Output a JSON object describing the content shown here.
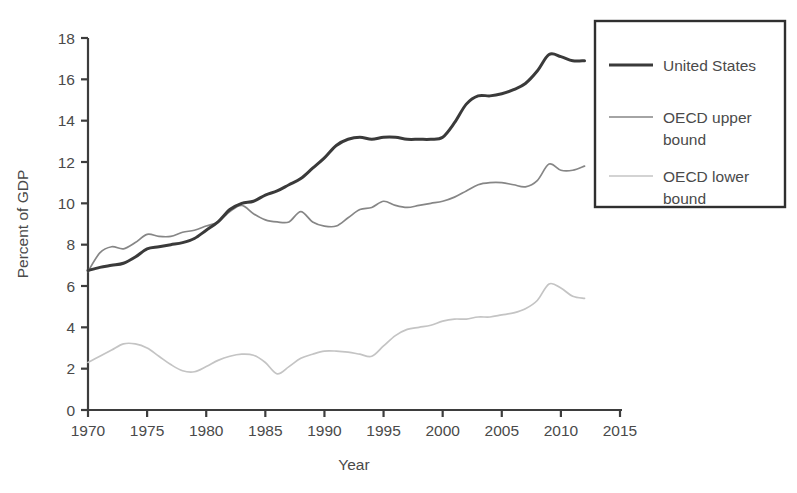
{
  "chart_data": {
    "type": "line",
    "title": "",
    "xlabel": "Year",
    "ylabel": "Percent of GDP",
    "xlim": [
      1970,
      2015
    ],
    "ylim": [
      0,
      18
    ],
    "xticks": [
      1970,
      1975,
      1980,
      1985,
      1990,
      1995,
      2000,
      2005,
      2010,
      2015
    ],
    "yticks": [
      0,
      2,
      4,
      6,
      8,
      10,
      12,
      14,
      16,
      18
    ],
    "grid": false,
    "legend_position": "top-right",
    "x": [
      1970,
      1971,
      1972,
      1973,
      1974,
      1975,
      1976,
      1977,
      1978,
      1979,
      1980,
      1981,
      1982,
      1983,
      1984,
      1985,
      1986,
      1987,
      1988,
      1989,
      1990,
      1991,
      1992,
      1993,
      1994,
      1995,
      1996,
      1997,
      1998,
      1999,
      2000,
      2001,
      2002,
      2003,
      2004,
      2005,
      2006,
      2007,
      2008,
      2009,
      2010,
      2011,
      2012
    ],
    "series": [
      {
        "name": "United States",
        "color": "#3a3a3a",
        "width": 3.0,
        "values": [
          6.75,
          6.9,
          7.0,
          7.1,
          7.4,
          7.8,
          7.9,
          8.0,
          8.1,
          8.3,
          8.7,
          9.1,
          9.7,
          10.0,
          10.1,
          10.4,
          10.6,
          10.9,
          11.2,
          11.7,
          12.2,
          12.8,
          13.1,
          13.2,
          13.1,
          13.2,
          13.2,
          13.1,
          13.1,
          13.1,
          13.2,
          13.9,
          14.8,
          15.2,
          15.2,
          15.3,
          15.5,
          15.8,
          16.4,
          17.2,
          17.1,
          16.9,
          16.9
        ]
      },
      {
        "name": "OECD upper bound",
        "color": "#868686",
        "width": 1.7,
        "values": [
          6.7,
          7.6,
          7.9,
          7.8,
          8.1,
          8.5,
          8.4,
          8.4,
          8.6,
          8.7,
          8.9,
          9.1,
          9.6,
          9.9,
          9.5,
          9.2,
          9.1,
          9.1,
          9.6,
          9.1,
          8.9,
          8.9,
          9.3,
          9.7,
          9.8,
          10.1,
          9.9,
          9.8,
          9.9,
          10.0,
          10.1,
          10.3,
          10.6,
          10.9,
          11.0,
          11.0,
          10.9,
          10.8,
          11.1,
          11.9,
          11.6,
          11.6,
          11.8
        ]
      },
      {
        "name": "OECD lower bound",
        "color": "#c4c4c4",
        "width": 1.7,
        "values": [
          2.3,
          2.6,
          2.9,
          3.2,
          3.2,
          3.0,
          2.6,
          2.2,
          1.9,
          1.85,
          2.1,
          2.4,
          2.6,
          2.7,
          2.65,
          2.3,
          1.75,
          2.1,
          2.5,
          2.7,
          2.85,
          2.85,
          2.8,
          2.7,
          2.6,
          3.1,
          3.6,
          3.9,
          4.0,
          4.1,
          4.3,
          4.4,
          4.4,
          4.5,
          4.5,
          4.6,
          4.7,
          4.9,
          5.3,
          6.1,
          5.9,
          5.5,
          5.4
        ]
      }
    ]
  },
  "legend": {
    "items": [
      {
        "label": "United States"
      },
      {
        "label": "OECD upper bound"
      },
      {
        "label": "OECD lower bound"
      }
    ]
  }
}
